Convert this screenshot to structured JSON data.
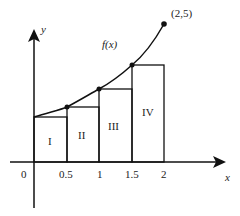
{
  "diagram": {
    "axes": {
      "x_label": "x",
      "y_label": "y",
      "origin_label": "0",
      "x_ticks": [
        "0.5",
        "1",
        "1.5",
        "2"
      ]
    },
    "curve": {
      "label": "f(x)",
      "endpoint_label": "(2,5)"
    },
    "rectangles": [
      {
        "label": "I",
        "x_start": 0,
        "x_end": 0.5
      },
      {
        "label": "II",
        "x_start": 0.5,
        "x_end": 1
      },
      {
        "label": "III",
        "x_start": 1,
        "x_end": 1.5
      },
      {
        "label": "IV",
        "x_start": 1.5,
        "x_end": 2
      }
    ],
    "colors": {
      "stroke": "#111111",
      "background": "#ffffff"
    }
  }
}
